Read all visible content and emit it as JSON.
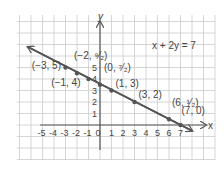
{
  "chart_data": {
    "type": "line",
    "title": "",
    "equation": "x + 2y = 7",
    "xlabel": "x",
    "ylabel": "y",
    "xlim": [
      -7,
      9
    ],
    "ylim": [
      -3,
      9
    ],
    "x_ticks": [
      "-5",
      "-4",
      "-3",
      "-2",
      "-1",
      "0",
      "1",
      "2",
      "3",
      "4",
      "5",
      "6",
      "7"
    ],
    "y_ticks": [
      "1",
      "2",
      "3",
      "4",
      "5"
    ],
    "grid": true,
    "series": [
      {
        "name": "x + 2y = 7",
        "line": {
          "from": [
            -5,
            6
          ],
          "to": [
            8,
            -0.5
          ]
        },
        "arrows": "both",
        "points": [
          {
            "x": -3,
            "y": 5,
            "label": "(-3, 5)"
          },
          {
            "x": -2,
            "y": 4.5,
            "label": "(-2, 9/2)"
          },
          {
            "x": -1,
            "y": 4,
            "label": "(-1, 4)"
          },
          {
            "x": 0,
            "y": 3.5,
            "label": "(0, 7/2)"
          },
          {
            "x": 1,
            "y": 3,
            "label": "(1, 3)"
          },
          {
            "x": 3,
            "y": 2,
            "label": "(3, 2)"
          },
          {
            "x": 6,
            "y": 0.5,
            "label": "(6, 1/2)"
          },
          {
            "x": 7,
            "y": 0,
            "label": "(7, 0)"
          }
        ]
      }
    ],
    "colors": {
      "line": "#555555",
      "grid": "#cccccc",
      "axis": "#555555",
      "text": "#444444"
    }
  }
}
